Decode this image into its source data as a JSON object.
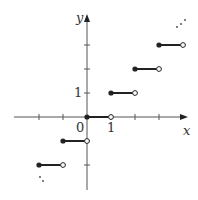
{
  "chart_data": {
    "type": "line",
    "title": "",
    "xlabel": "x",
    "ylabel": "y",
    "tick_labels": {
      "origin": "0",
      "x_one": "1",
      "y_one": "1"
    },
    "xlim": [
      -3.1,
      4.2
    ],
    "ylim": [
      -3.1,
      4.2
    ],
    "grid": false,
    "segments": [
      {
        "x_start": -2,
        "x_end": -1,
        "y": -2,
        "start": "closed",
        "end": "open"
      },
      {
        "x_start": -1,
        "x_end": 0,
        "y": -1,
        "start": "closed",
        "end": "open"
      },
      {
        "x_start": 0,
        "x_end": 1,
        "y": 0,
        "start": "closed",
        "end": "open"
      },
      {
        "x_start": 1,
        "x_end": 2,
        "y": 1,
        "start": "closed",
        "end": "open"
      },
      {
        "x_start": 2,
        "x_end": 3,
        "y": 2,
        "start": "closed",
        "end": "open"
      },
      {
        "x_start": 3,
        "x_end": 4,
        "y": 3,
        "start": "closed",
        "end": "open"
      }
    ],
    "annotations": [
      "continuation dots upper right",
      "continuation dots lower left"
    ],
    "colors": {
      "axis": "#555555",
      "step": "#222222"
    }
  }
}
